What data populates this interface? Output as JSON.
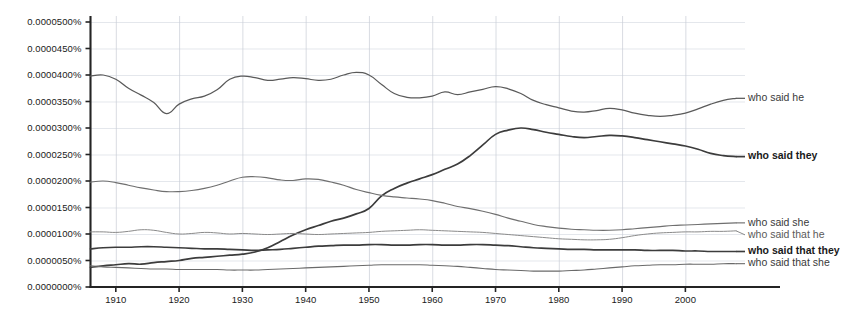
{
  "chart_data": {
    "type": "line",
    "title": "",
    "xlabel": "",
    "ylabel": "",
    "xlim": [
      1906,
      2008
    ],
    "ylim": [
      0.0,
      5e-05
    ],
    "grid": true,
    "legend_position": "right-inline-labels",
    "y_tick_labels": [
      "0.0000500%",
      "0.0000450%",
      "0.0000400%",
      "0.0000350%",
      "0.0000300%",
      "0.0000250%",
      "0.0000200%",
      "0.0000150%",
      "0.0000100%",
      "0.0000050%",
      "0.0000000%"
    ],
    "y_tick_values": [
      5e-05,
      4.5e-05,
      4e-05,
      3.5e-05,
      3e-05,
      2.5e-05,
      2e-05,
      1.5e-05,
      1e-05,
      5e-06,
      0.0
    ],
    "x_tick_labels": [
      "1910",
      "1920",
      "1930",
      "1940",
      "1950",
      "1960",
      "1970",
      "1980",
      "1990",
      "2000"
    ],
    "x_tick_values": [
      1910,
      1920,
      1930,
      1940,
      1950,
      1960,
      1970,
      1980,
      1990,
      2000
    ],
    "x": [
      1906,
      1908,
      1910,
      1912,
      1914,
      1916,
      1918,
      1920,
      1922,
      1924,
      1926,
      1928,
      1930,
      1932,
      1934,
      1936,
      1938,
      1940,
      1942,
      1944,
      1946,
      1948,
      1950,
      1952,
      1954,
      1956,
      1958,
      1960,
      1962,
      1964,
      1966,
      1968,
      1970,
      1972,
      1974,
      1976,
      1978,
      1980,
      1982,
      1984,
      1986,
      1988,
      1990,
      1992,
      1994,
      1996,
      1998,
      2000,
      2002,
      2004,
      2006,
      2008
    ],
    "series": [
      {
        "name": "who said he",
        "color": "#5a5a5a",
        "width": 1.25,
        "label_weight": "normal",
        "label_color": "#3a3a3a",
        "values": [
          3.98e-05,
          4e-05,
          3.92e-05,
          3.75e-05,
          3.62e-05,
          3.48e-05,
          3.27e-05,
          3.45e-05,
          3.55e-05,
          3.6e-05,
          3.72e-05,
          3.92e-05,
          3.98e-05,
          3.95e-05,
          3.9e-05,
          3.92e-05,
          3.95e-05,
          3.93e-05,
          3.9e-05,
          3.92e-05,
          4e-05,
          4.05e-05,
          4e-05,
          3.82e-05,
          3.65e-05,
          3.58e-05,
          3.57e-05,
          3.6e-05,
          3.68e-05,
          3.63e-05,
          3.68e-05,
          3.73e-05,
          3.78e-05,
          3.74e-05,
          3.65e-05,
          3.52e-05,
          3.44e-05,
          3.38e-05,
          3.32e-05,
          3.3e-05,
          3.33e-05,
          3.37e-05,
          3.34e-05,
          3.28e-05,
          3.24e-05,
          3.22e-05,
          3.24e-05,
          3.28e-05,
          3.36e-05,
          3.45e-05,
          3.52e-05,
          3.56e-05
        ]
      },
      {
        "name": "who said they",
        "color": "#3c3c3c",
        "width": 1.7,
        "label_weight": "bold",
        "label_color": "#1a1a1a",
        "values": [
          3.7e-06,
          4e-06,
          4.2e-06,
          4.4e-06,
          4.3e-06,
          4.6e-06,
          4.8e-06,
          5e-06,
          5.4e-06,
          5.6e-06,
          5.8e-06,
          6e-06,
          6.2e-06,
          6.6e-06,
          7.4e-06,
          8.6e-06,
          9.8e-06,
          1.08e-05,
          1.16e-05,
          1.24e-05,
          1.3e-05,
          1.38e-05,
          1.48e-05,
          1.72e-05,
          1.86e-05,
          1.96e-05,
          2.04e-05,
          2.12e-05,
          2.22e-05,
          2.32e-05,
          2.48e-05,
          2.68e-05,
          2.88e-05,
          2.96e-05,
          3e-05,
          2.97e-05,
          2.92e-05,
          2.88e-05,
          2.84e-05,
          2.82e-05,
          2.84e-05,
          2.86e-05,
          2.85e-05,
          2.82e-05,
          2.78e-05,
          2.74e-05,
          2.7e-05,
          2.66e-05,
          2.6e-05,
          2.52e-05,
          2.48e-05,
          2.46e-05
        ]
      },
      {
        "name": "who said she",
        "color": "#6f6f6f",
        "width": 1.15,
        "label_weight": "normal",
        "label_color": "#3a3a3a",
        "values": [
          1.98e-05,
          2e-05,
          1.97e-05,
          1.92e-05,
          1.87e-05,
          1.83e-05,
          1.8e-05,
          1.8e-05,
          1.82e-05,
          1.86e-05,
          1.92e-05,
          2e-05,
          2.07e-05,
          2.08e-05,
          2.06e-05,
          2.02e-05,
          2.01e-05,
          2.04e-05,
          2.03e-05,
          1.98e-05,
          1.92e-05,
          1.84e-05,
          1.78e-05,
          1.73e-05,
          1.7e-05,
          1.68e-05,
          1.66e-05,
          1.63e-05,
          1.58e-05,
          1.52e-05,
          1.48e-05,
          1.43e-05,
          1.37e-05,
          1.3e-05,
          1.24e-05,
          1.18e-05,
          1.14e-05,
          1.11e-05,
          1.09e-05,
          1.08e-05,
          1.07e-05,
          1.07e-05,
          1.08e-05,
          1.1e-05,
          1.12e-05,
          1.14e-05,
          1.16e-05,
          1.17e-05,
          1.18e-05,
          1.19e-05,
          1.2e-05,
          1.21e-05
        ]
      },
      {
        "name": "who said that he",
        "color": "#8a8a8a",
        "width": 1.0,
        "label_weight": "normal",
        "label_color": "#5a5a5a",
        "values": [
          1.04e-05,
          1.04e-05,
          1.03e-05,
          1.05e-05,
          1.08e-05,
          1.07e-05,
          1.03e-05,
          1e-05,
          1.01e-05,
          1.03e-05,
          1.02e-05,
          1e-05,
          1.01e-05,
          1e-05,
          9.9e-06,
          1e-05,
          1.01e-05,
          1e-05,
          9.9e-06,
          1e-05,
          1.01e-05,
          1.02e-05,
          1.03e-05,
          1.05e-05,
          1.06e-05,
          1.07e-05,
          1.08e-05,
          1.07e-05,
          1.06e-05,
          1.05e-05,
          1.04e-05,
          1.03e-05,
          1.01e-05,
          9.9e-06,
          9.7e-06,
          9.5e-06,
          9.3e-06,
          9.1e-06,
          9e-06,
          8.9e-06,
          8.9e-06,
          9e-06,
          9.3e-06,
          9.7e-06,
          1e-05,
          1.02e-05,
          1.03e-05,
          1.04e-05,
          1.04e-05,
          1.05e-05,
          1.05e-05,
          1.06e-05
        ]
      },
      {
        "name": "who said that they",
        "color": "#3c3c3c",
        "width": 1.65,
        "label_weight": "bold",
        "label_color": "#1a1a1a",
        "values": [
          7.2e-06,
          7.4e-06,
          7.5e-06,
          7.5e-06,
          7.6e-06,
          7.6e-06,
          7.5e-06,
          7.4e-06,
          7.3e-06,
          7.2e-06,
          7.2e-06,
          7.1e-06,
          7e-06,
          6.9e-06,
          7e-06,
          7.1e-06,
          7.3e-06,
          7.5e-06,
          7.7e-06,
          7.8e-06,
          7.9e-06,
          7.9e-06,
          8e-06,
          8e-06,
          7.9e-06,
          7.9e-06,
          8e-06,
          8e-06,
          7.9e-06,
          7.9e-06,
          8e-06,
          8e-06,
          7.9e-06,
          7.8e-06,
          7.6e-06,
          7.4e-06,
          7.3e-06,
          7.2e-06,
          7.1e-06,
          7.1e-06,
          7e-06,
          7e-06,
          7e-06,
          7e-06,
          6.9e-06,
          6.9e-06,
          6.9e-06,
          6.8e-06,
          6.8e-06,
          6.7e-06,
          6.7e-06,
          6.7e-06
        ]
      },
      {
        "name": "who said that she",
        "color": "#6a6a6a",
        "width": 1.1,
        "label_weight": "normal",
        "label_color": "#3a3a3a",
        "values": [
          4e-06,
          3.8e-06,
          3.7e-06,
          3.6e-06,
          3.5e-06,
          3.4e-06,
          3.4e-06,
          3.3e-06,
          3.3e-06,
          3.3e-06,
          3.3e-06,
          3.2e-06,
          3.2e-06,
          3.2e-06,
          3.3e-06,
          3.4e-06,
          3.5e-06,
          3.6e-06,
          3.7e-06,
          3.8e-06,
          3.9e-06,
          4e-06,
          4.1e-06,
          4.2e-06,
          4.2e-06,
          4.2e-06,
          4.2e-06,
          4.1e-06,
          4e-06,
          3.9e-06,
          3.7e-06,
          3.5e-06,
          3.3e-06,
          3.2e-06,
          3.1e-06,
          3e-06,
          3e-06,
          3e-06,
          3.1e-06,
          3.2e-06,
          3.4e-06,
          3.6e-06,
          3.8e-06,
          4e-06,
          4.1e-06,
          4.2e-06,
          4.2e-06,
          4.3e-06,
          4.3e-06,
          4.3e-06,
          4.4e-06,
          4.4e-06
        ]
      }
    ]
  },
  "labels": {
    "who_said_he": "who said he",
    "who_said_they": "who said they",
    "who_said_she": "who said she",
    "who_said_that_he": "who said that he",
    "who_said_that_they": "who said that they",
    "who_said_that_she": "who said that she"
  }
}
